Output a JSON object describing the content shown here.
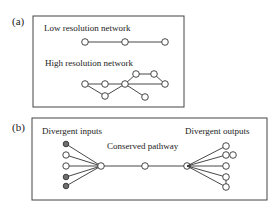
{
  "panels": {
    "a": {
      "label": "(a)",
      "low_title": "Low resolution network",
      "high_title": "High resolution network"
    },
    "b": {
      "label": "(b)",
      "inputs_title": "Divergent inputs",
      "pathway_title": "Conserved pathway",
      "outputs_title": "Divergent outputs"
    }
  },
  "colors": {
    "line": "#333333",
    "node_fill": "#ffffff",
    "node_filled": "#6e6e6e",
    "box": "#444444"
  }
}
